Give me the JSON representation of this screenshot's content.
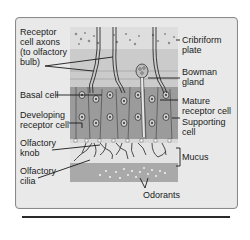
{
  "figure": {
    "labels_left": [
      {
        "id": "receptor-cell-axons",
        "text": "Receptor\ncell axons\n(to olfactory\nbulb)"
      },
      {
        "id": "basal-cell",
        "text": "Basal cell"
      },
      {
        "id": "developing-receptor-cell",
        "text": "Developing\nreceptor cell"
      },
      {
        "id": "olfactory-knob",
        "text": "Olfactory\nknob"
      },
      {
        "id": "olfactory-cilia",
        "text": "Olfactory\ncilia"
      }
    ],
    "labels_right": [
      {
        "id": "cribriform-plate",
        "text": "Cribriform\nplate"
      },
      {
        "id": "bowman-gland",
        "text": "Bowman\ngland"
      },
      {
        "id": "mature-receptor-cell",
        "text": "Mature\nreceptor cell"
      },
      {
        "id": "supporting-cell",
        "text": "Supporting\ncell"
      },
      {
        "id": "mucus",
        "text": "Mucus"
      }
    ],
    "labels_bottom": [
      {
        "id": "odorants",
        "text": "Odorants"
      }
    ],
    "colors": {
      "panel_bg": "#e9e9e9",
      "panel_border": "#8a8a8a",
      "cribriform": "#dcdcdc",
      "connective": "#c9c9c9",
      "cell_layer": "#9a9a9a",
      "nucleus": "#6e6e6e",
      "mucus": "#e2e2e2",
      "odorant_zone": "#a8a8a8",
      "line": "#222222"
    }
  }
}
